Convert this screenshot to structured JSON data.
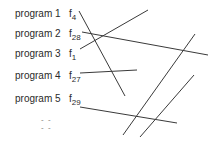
{
  "programs": [
    {
      "label": "program 1",
      "func": "f",
      "sub": "4"
    },
    {
      "label": "program 2",
      "func": "f",
      "sub": "28"
    },
    {
      "label": "program 3",
      "func": "f",
      "sub": "1"
    },
    {
      "label": "program 4",
      "func": "f",
      "sub": "27"
    },
    {
      "label": "program 5",
      "func": "f",
      "sub": "29"
    }
  ],
  "ellipsis": [
    "- -",
    "- -"
  ],
  "line_color": "#3a3a3a"
}
